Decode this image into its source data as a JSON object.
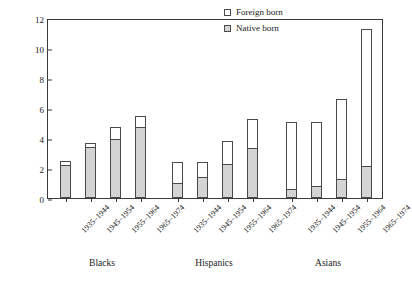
{
  "chart_data": {
    "type": "bar",
    "title": "",
    "subtitle": "",
    "xlabel": "",
    "ylabel": "Percent of occupational cohort",
    "ylim": [
      0,
      12
    ],
    "yticks": [
      0,
      2,
      4,
      6,
      8,
      10,
      12
    ],
    "grid": false,
    "stacked": true,
    "legend_position": "top-right",
    "legend": [
      {
        "name": "Foreign born",
        "color": "#ffffff"
      },
      {
        "name": "Native born",
        "color": "#d4d4d4"
      }
    ],
    "categories": [
      "1935-1944",
      "1945-1954",
      "1955-1964",
      "1965-1974"
    ],
    "groups": [
      {
        "name": "Blacks",
        "bars": [
          {
            "category": "1935-1944",
            "native_born": 2.2,
            "foreign_born": 0.3,
            "total": 2.5
          },
          {
            "category": "1945-1954",
            "native_born": 3.4,
            "foreign_born": 0.3,
            "total": 3.7
          },
          {
            "category": "1955-1964",
            "native_born": 3.95,
            "foreign_born": 0.8,
            "total": 4.75
          },
          {
            "category": "1965-1974",
            "native_born": 4.75,
            "foreign_born": 0.75,
            "total": 5.5
          }
        ]
      },
      {
        "name": "Hispanics",
        "bars": [
          {
            "category": "1935-1944",
            "native_born": 1.0,
            "foreign_born": 1.4,
            "total": 2.4
          },
          {
            "category": "1945-1954",
            "native_born": 1.4,
            "foreign_born": 1.0,
            "total": 2.4
          },
          {
            "category": "1955-1964",
            "native_born": 2.25,
            "foreign_born": 1.55,
            "total": 3.8
          },
          {
            "category": "1965-1974",
            "native_born": 3.35,
            "foreign_born": 1.95,
            "total": 5.3
          }
        ]
      },
      {
        "name": "Asians",
        "bars": [
          {
            "category": "1935-1944",
            "native_born": 0.6,
            "foreign_born": 4.5,
            "total": 5.1
          },
          {
            "category": "1945-1954",
            "native_born": 0.8,
            "foreign_born": 4.3,
            "total": 5.1
          },
          {
            "category": "1955-1964",
            "native_born": 1.25,
            "foreign_born": 5.35,
            "total": 6.6
          },
          {
            "category": "1965-1974",
            "native_born": 2.15,
            "foreign_born": 9.15,
            "total": 11.3
          }
        ]
      }
    ],
    "colors": {
      "foreign_born": "#ffffff",
      "native_born": "#d4d4d4",
      "axis": "#3a3a3a",
      "bar_outline": "#4a4a4a",
      "text": "#1a1a1a",
      "background": "#ffffff"
    }
  }
}
